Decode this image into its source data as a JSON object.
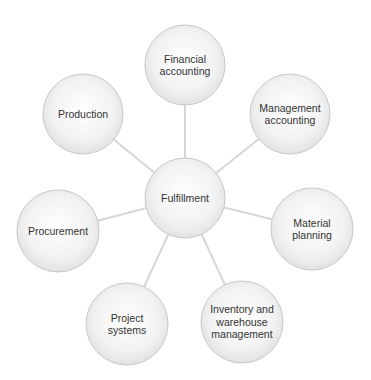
{
  "diagram": {
    "type": "hub-and-spoke",
    "colors": {
      "background": "#ffffff",
      "connector": "#d6d6d6",
      "node_border": "#c8c8c8",
      "node_fill_center": "#ffffff",
      "node_fill_edge": "#e4e4e4",
      "text": "#333333"
    },
    "hub": {
      "label": "Fulfillment",
      "cx": 185,
      "cy": 198,
      "r": 40
    },
    "nodes": [
      {
        "id": "financial-accounting",
        "label": "Financial\naccounting",
        "cx": 185,
        "cy": 65,
        "r": 40
      },
      {
        "id": "management-accounting",
        "label": "Management\naccounting",
        "cx": 290,
        "cy": 114,
        "r": 40
      },
      {
        "id": "material-planning",
        "label": "Material\nplanning",
        "cx": 312,
        "cy": 229,
        "r": 41
      },
      {
        "id": "inventory-warehouse-management",
        "label": "Inventory and\nwarehouse\nmanagement",
        "cx": 242,
        "cy": 322,
        "r": 41
      },
      {
        "id": "project-systems",
        "label": "Project\nsystems",
        "cx": 127,
        "cy": 324,
        "r": 41
      },
      {
        "id": "procurement",
        "label": "Procurement",
        "cx": 58,
        "cy": 231,
        "r": 41
      },
      {
        "id": "production",
        "label": "Production",
        "cx": 83,
        "cy": 114,
        "r": 40
      }
    ]
  }
}
